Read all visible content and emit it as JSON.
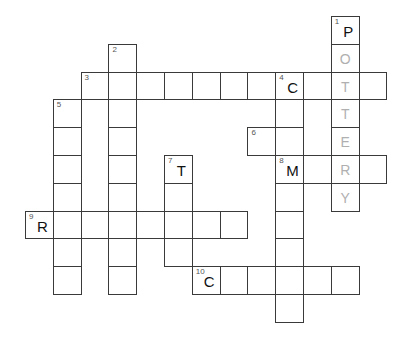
{
  "puzzle": {
    "type": "crossword",
    "grid": {
      "origin_x": 25,
      "origin_y": 16,
      "cell_size": 27.8
    },
    "colors": {
      "border": "#3a3a3a",
      "given_letter": "#111111",
      "solution_letter": "#b0b0b0",
      "number": "#555555"
    },
    "words": [
      {
        "number": "1",
        "direction": "down",
        "row": 0,
        "col": 11,
        "length": 7,
        "letters": [
          "P",
          "O",
          "T",
          "T",
          "E",
          "R",
          "Y"
        ],
        "given": [
          true,
          false,
          false,
          false,
          false,
          false,
          false
        ]
      },
      {
        "number": "2",
        "direction": "down",
        "row": 1,
        "col": 3,
        "length": 9,
        "letters": [
          "",
          "",
          "",
          "",
          "",
          "",
          "",
          "",
          ""
        ],
        "given": []
      },
      {
        "number": "3",
        "direction": "across",
        "row": 2,
        "col": 2,
        "length": 11,
        "letters": [
          "",
          "",
          "",
          "",
          "",
          "",
          "",
          "C",
          "",
          "T",
          ""
        ],
        "given": [
          false,
          false,
          false,
          false,
          false,
          false,
          false,
          true,
          false,
          false,
          false
        ]
      },
      {
        "number": "4",
        "direction": "down",
        "row": 2,
        "col": 9,
        "length": 9,
        "letters": [
          "C",
          "",
          "",
          "M",
          "",
          "",
          "",
          "",
          ""
        ],
        "given": [
          true,
          false,
          false,
          true
        ]
      },
      {
        "number": "5",
        "direction": "down",
        "row": 3,
        "col": 1,
        "length": 7,
        "letters": [
          "",
          "",
          "",
          "",
          "",
          "",
          ""
        ],
        "given": []
      },
      {
        "number": "6",
        "direction": "across",
        "row": 4,
        "col": 8,
        "length": 2,
        "letters": [
          "",
          ""
        ],
        "given": []
      },
      {
        "number": "7",
        "direction": "down",
        "row": 5,
        "col": 5,
        "length": 4,
        "letters": [
          "T",
          "",
          "",
          ""
        ],
        "given": [
          true
        ]
      },
      {
        "number": "8",
        "direction": "across",
        "row": 5,
        "col": 9,
        "length": 4,
        "letters": [
          "M",
          "",
          "R",
          ""
        ],
        "given": [
          true
        ]
      },
      {
        "number": "9",
        "direction": "across",
        "row": 7,
        "col": 0,
        "length": 8,
        "letters": [
          "R",
          "",
          "",
          "",
          "",
          "",
          "",
          ""
        ],
        "given": [
          true
        ]
      },
      {
        "number": "10",
        "direction": "across",
        "row": 9,
        "col": 6,
        "length": 6,
        "letters": [
          "C",
          "",
          "",
          "",
          "",
          ""
        ],
        "given": [
          true
        ]
      }
    ],
    "cells": [
      {
        "r": 0,
        "c": 11,
        "num": "1",
        "letter": "P",
        "kind": "given"
      },
      {
        "r": 1,
        "c": 11,
        "letter": "O",
        "kind": "solution"
      },
      {
        "r": 2,
        "c": 11,
        "letter": "T",
        "kind": "solution"
      },
      {
        "r": 3,
        "c": 11,
        "letter": "T",
        "kind": "solution"
      },
      {
        "r": 4,
        "c": 11,
        "letter": "E",
        "kind": "solution"
      },
      {
        "r": 5,
        "c": 11,
        "letter": "R",
        "kind": "solution"
      },
      {
        "r": 6,
        "c": 11,
        "letter": "Y",
        "kind": "solution"
      },
      {
        "r": 1,
        "c": 3,
        "num": "2"
      },
      {
        "r": 2,
        "c": 3
      },
      {
        "r": 3,
        "c": 3
      },
      {
        "r": 4,
        "c": 3
      },
      {
        "r": 5,
        "c": 3
      },
      {
        "r": 6,
        "c": 3
      },
      {
        "r": 7,
        "c": 3
      },
      {
        "r": 8,
        "c": 3
      },
      {
        "r": 9,
        "c": 3
      },
      {
        "r": 2,
        "c": 2,
        "num": "3"
      },
      {
        "r": 2,
        "c": 4
      },
      {
        "r": 2,
        "c": 5
      },
      {
        "r": 2,
        "c": 6
      },
      {
        "r": 2,
        "c": 7
      },
      {
        "r": 2,
        "c": 8
      },
      {
        "r": 2,
        "c": 9,
        "num": "4",
        "letter": "C",
        "kind": "given"
      },
      {
        "r": 2,
        "c": 10
      },
      {
        "r": 2,
        "c": 12
      },
      {
        "r": 3,
        "c": 9
      },
      {
        "r": 4,
        "c": 9
      },
      {
        "r": 5,
        "c": 9,
        "num": "8",
        "letter": "M",
        "kind": "given"
      },
      {
        "r": 6,
        "c": 9
      },
      {
        "r": 7,
        "c": 9
      },
      {
        "r": 8,
        "c": 9
      },
      {
        "r": 9,
        "c": 9
      },
      {
        "r": 10,
        "c": 9
      },
      {
        "r": 3,
        "c": 1,
        "num": "5"
      },
      {
        "r": 4,
        "c": 1
      },
      {
        "r": 5,
        "c": 1
      },
      {
        "r": 6,
        "c": 1
      },
      {
        "r": 7,
        "c": 1
      },
      {
        "r": 8,
        "c": 1
      },
      {
        "r": 9,
        "c": 1
      },
      {
        "r": 4,
        "c": 8,
        "num": "6"
      },
      {
        "r": 5,
        "c": 5,
        "num": "7",
        "letter": "T",
        "kind": "given"
      },
      {
        "r": 6,
        "c": 5
      },
      {
        "r": 7,
        "c": 5
      },
      {
        "r": 8,
        "c": 5
      },
      {
        "r": 5,
        "c": 10
      },
      {
        "r": 5,
        "c": 12
      },
      {
        "r": 7,
        "c": 0,
        "num": "9",
        "letter": "R",
        "kind": "given"
      },
      {
        "r": 7,
        "c": 2
      },
      {
        "r": 7,
        "c": 4
      },
      {
        "r": 7,
        "c": 6
      },
      {
        "r": 7,
        "c": 7
      },
      {
        "r": 9,
        "c": 6,
        "num": "10",
        "letter": "C",
        "kind": "given"
      },
      {
        "r": 9,
        "c": 7
      },
      {
        "r": 9,
        "c": 8
      },
      {
        "r": 9,
        "c": 10
      },
      {
        "r": 9,
        "c": 11
      }
    ]
  }
}
